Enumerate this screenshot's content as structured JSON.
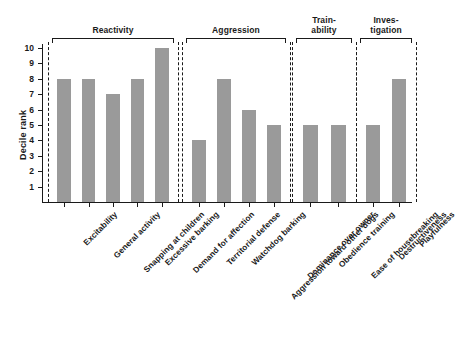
{
  "chart_data": {
    "type": "bar",
    "title": "",
    "xlabel": "",
    "ylabel": "Decile rank",
    "ylim": [
      0,
      10
    ],
    "ytick_labels": [
      "10",
      "9",
      "8",
      "7",
      "6",
      "5",
      "4",
      "3",
      "2",
      "1"
    ],
    "yticks": [
      10,
      9,
      8,
      7,
      6,
      5,
      4,
      3,
      2,
      1
    ],
    "grid": false,
    "legend": "none",
    "bar_color": "#9a9a9a",
    "axis_color": "#1a1a1a",
    "categories": [
      "Excitability",
      "General activity",
      "Snapping at children",
      "Excessive barking",
      "Demand for affection",
      "Territorial defense",
      "Watchdog barking",
      "Aggression toward other dogs",
      "Dominance over owner",
      "Obedience training",
      "Ease of housebreaking",
      "Destructiveness",
      "Playfulness"
    ],
    "values": [
      8,
      8,
      7,
      8,
      10,
      4,
      8,
      6,
      5,
      5,
      5,
      5,
      8
    ],
    "groups": [
      {
        "label": "Reactivity",
        "label_lines": "Reactivity",
        "categories": [
          "Excitability",
          "General activity",
          "Snapping at children",
          "Excessive barking",
          "Demand for affection"
        ],
        "values": [
          8,
          8,
          7,
          8,
          10
        ]
      },
      {
        "label": "Aggression",
        "label_lines": "Aggression",
        "categories": [
          "Territorial defense",
          "Watchdog barking",
          "Aggression toward other dogs",
          "Dominance over owner"
        ],
        "values": [
          4,
          8,
          6,
          5
        ]
      },
      {
        "label": "Train-ability",
        "label_lines": "Train-\nability",
        "categories": [
          "Obedience training",
          "Ease of housebreaking"
        ],
        "values": [
          5,
          5
        ]
      },
      {
        "label": "Investigation",
        "label_lines": "Inves-\ntigation",
        "categories": [
          "Destructiveness",
          "Playfulness"
        ],
        "values": [
          5,
          8
        ]
      }
    ]
  }
}
